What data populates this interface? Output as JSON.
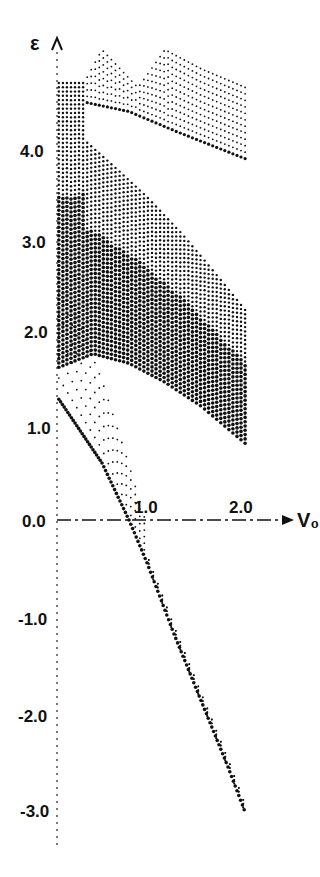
{
  "chart_data": {
    "type": "scatter",
    "title": "",
    "xlabel": "V₀",
    "ylabel": "ε",
    "xlim": [
      0,
      2.3
    ],
    "ylim": [
      -3.3,
      5.0
    ],
    "grid": false,
    "legend": null,
    "x_ticks": [
      {
        "value": 1.0,
        "label": "1.0"
      },
      {
        "value": 2.0,
        "label": "2.0"
      }
    ],
    "y_ticks": [
      {
        "value": 4.0,
        "label": "4.0"
      },
      {
        "value": 3.0,
        "label": "3.0"
      },
      {
        "value": 2.0,
        "label": "2.0"
      },
      {
        "value": 1.0,
        "label": "1.0"
      },
      {
        "value": 0.0,
        "label": "0.0"
      },
      {
        "value": -1.0,
        "label": "-1.0"
      },
      {
        "value": -2.0,
        "label": "-2.0"
      },
      {
        "value": -3.0,
        "label": "-3.0"
      }
    ],
    "series": [
      {
        "name": "lower-branch",
        "description": "Levels dropping from ~1.3 at V₀=0 to ~-3.1 at V₀≈2.1",
        "points": [
          [
            0.0,
            1.3
          ],
          [
            0.5,
            0.6
          ],
          [
            0.8,
            0.0
          ],
          [
            1.0,
            -0.45
          ],
          [
            1.3,
            -1.2
          ],
          [
            1.6,
            -1.9
          ],
          [
            1.9,
            -2.6
          ],
          [
            2.1,
            -3.1
          ]
        ]
      },
      {
        "name": "middle-band-bottom",
        "description": "Lower edge of the dense middle band",
        "points": [
          [
            0.0,
            1.6
          ],
          [
            0.4,
            1.75
          ],
          [
            0.8,
            1.65
          ],
          [
            1.2,
            1.45
          ],
          [
            1.6,
            1.2
          ],
          [
            2.1,
            0.8
          ]
        ]
      },
      {
        "name": "middle-band-top",
        "description": "Upper edge of the dense middle band",
        "points": [
          [
            0.3,
            4.0
          ],
          [
            0.6,
            3.75
          ],
          [
            1.0,
            3.4
          ],
          [
            1.4,
            3.0
          ],
          [
            1.8,
            2.55
          ],
          [
            2.1,
            2.2
          ]
        ]
      },
      {
        "name": "upper-band-bottom",
        "description": "Lower edge of the upper-right band",
        "points": [
          [
            0.3,
            4.4
          ],
          [
            0.8,
            4.3
          ],
          [
            1.3,
            4.1
          ],
          [
            1.7,
            3.95
          ],
          [
            2.1,
            3.8
          ]
        ]
      },
      {
        "name": "upper-band-top",
        "description": "Upper edge (peaks) of the upper-right band",
        "points": [
          [
            0.3,
            4.6
          ],
          [
            0.5,
            4.95
          ],
          [
            0.9,
            4.55
          ],
          [
            1.2,
            4.95
          ],
          [
            1.6,
            4.75
          ],
          [
            2.1,
            4.55
          ]
        ]
      }
    ]
  }
}
